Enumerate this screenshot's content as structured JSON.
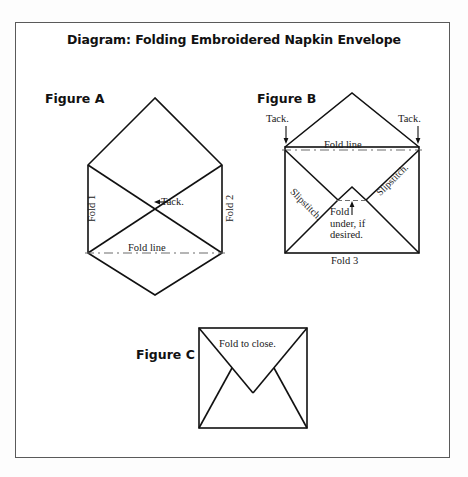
{
  "title": "Diagram:  Folding Embroidered Napkin Envelope",
  "figures": {
    "a": {
      "label": "Figure A",
      "fold1": "Fold 1",
      "fold2": "Fold 2",
      "tack": "Tack.",
      "tack_arrow": "←",
      "fold_line": "Fold line"
    },
    "b": {
      "label": "Figure B",
      "tack_left": "Tack.",
      "tack_right": "Tack.",
      "tack_arrow": "↓",
      "fold_line": "Fold line",
      "slipstitch_left": "Slipstitch.",
      "slipstitch_right": "Slipstitch.",
      "fold_under_arrow": "↑",
      "fold_under_line1": "Fold",
      "fold_under_line2": "under, if",
      "fold_under_line3": "desired.",
      "fold3": "Fold 3"
    },
    "c": {
      "label": "Figure C",
      "fold_to_close": "Fold to close."
    }
  },
  "colors": {
    "frame": "#5a5a5a",
    "stroke": "#111111",
    "dash": "#6d6d6d",
    "text": "#1a1a1a",
    "background": "#ffffff"
  }
}
